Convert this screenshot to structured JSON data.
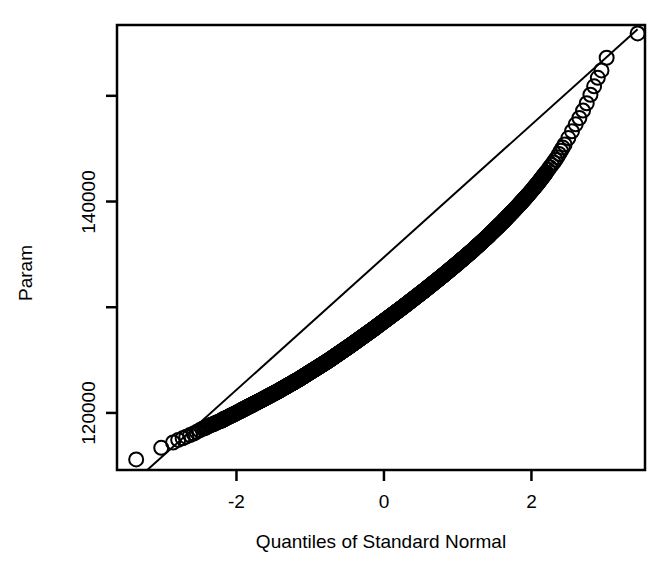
{
  "chart_data": {
    "type": "scatter",
    "subtype": "qq-plot",
    "title": "",
    "xlabel": "Quantiles of Standard Normal",
    "ylabel": "Param",
    "xlim": [
      -3.62,
      3.54
    ],
    "ylim": [
      114600,
      156700
    ],
    "grid": false,
    "legend": null,
    "x_ticks": [
      {
        "value": -2,
        "label": "-2"
      },
      {
        "value": 0,
        "label": "0"
      },
      {
        "value": 2,
        "label": "2"
      }
    ],
    "y_ticks": [
      {
        "value": 150000,
        "label": ""
      },
      {
        "value": 140000,
        "label": "140000"
      },
      {
        "value": 130000,
        "label": ""
      },
      {
        "value": 120000,
        "label": "120000"
      }
    ],
    "reference_line": {
      "name": "qq-line",
      "x1": -3.21,
      "y1": 114600,
      "x2": 3.44,
      "y2": 156300
    },
    "marker": {
      "shape": "open-circle",
      "radius_px": 7,
      "stroke": "#000000",
      "fill": "none",
      "stroke_width": 2
    },
    "series": [
      {
        "name": "Param quantiles",
        "points": [
          [
            -3.36,
            115600
          ],
          [
            -3.02,
            116700
          ],
          [
            -2.86,
            117200
          ],
          [
            -2.79,
            117450
          ],
          [
            -2.73,
            117600
          ],
          [
            -2.68,
            117750
          ],
          [
            -2.63,
            117900
          ],
          [
            -2.58,
            118050
          ],
          [
            -2.54,
            118200
          ],
          [
            -2.5,
            118350
          ],
          [
            -2.46,
            118500
          ],
          [
            -2.42,
            118600
          ],
          [
            -2.38,
            118750
          ],
          [
            -2.35,
            118850
          ],
          [
            -2.31,
            118950
          ],
          [
            -2.28,
            119050
          ],
          [
            -2.25,
            119150
          ],
          [
            -2.21,
            119250
          ],
          [
            -2.18,
            119380
          ],
          [
            -2.15,
            119480
          ],
          [
            -2.1,
            119650
          ],
          [
            -2.05,
            119820
          ],
          [
            -2.0,
            120000
          ],
          [
            -1.95,
            120180
          ],
          [
            -1.9,
            120360
          ],
          [
            -1.85,
            120540
          ],
          [
            -1.8,
            120720
          ],
          [
            -1.75,
            120900
          ],
          [
            -1.7,
            121080
          ],
          [
            -1.65,
            121260
          ],
          [
            -1.6,
            121450
          ],
          [
            -1.55,
            121630
          ],
          [
            -1.5,
            121820
          ],
          [
            -1.45,
            122000
          ],
          [
            -1.4,
            122200
          ],
          [
            -1.35,
            122400
          ],
          [
            -1.3,
            122600
          ],
          [
            -1.25,
            122800
          ],
          [
            -1.2,
            123000
          ],
          [
            -1.15,
            123200
          ],
          [
            -1.1,
            123420
          ],
          [
            -1.05,
            123640
          ],
          [
            -1.0,
            123860
          ],
          [
            -0.95,
            124080
          ],
          [
            -0.9,
            124300
          ],
          [
            -0.85,
            124520
          ],
          [
            -0.8,
            124740
          ],
          [
            -0.75,
            124960
          ],
          [
            -0.7,
            125200
          ],
          [
            -0.65,
            125440
          ],
          [
            -0.6,
            125680
          ],
          [
            -0.55,
            125920
          ],
          [
            -0.5,
            126160
          ],
          [
            -0.45,
            126400
          ],
          [
            -0.4,
            126650
          ],
          [
            -0.35,
            126900
          ],
          [
            -0.3,
            127150
          ],
          [
            -0.25,
            127400
          ],
          [
            -0.2,
            127650
          ],
          [
            -0.15,
            127900
          ],
          [
            -0.1,
            128160
          ],
          [
            -0.05,
            128420
          ],
          [
            0.0,
            128680
          ],
          [
            0.05,
            128940
          ],
          [
            0.1,
            129200
          ],
          [
            0.15,
            129460
          ],
          [
            0.2,
            129720
          ],
          [
            0.25,
            129980
          ],
          [
            0.3,
            130250
          ],
          [
            0.35,
            130520
          ],
          [
            0.4,
            130790
          ],
          [
            0.45,
            131060
          ],
          [
            0.5,
            131330
          ],
          [
            0.55,
            131600
          ],
          [
            0.6,
            131880
          ],
          [
            0.65,
            132160
          ],
          [
            0.7,
            132440
          ],
          [
            0.75,
            132720
          ],
          [
            0.8,
            133000
          ],
          [
            0.85,
            133290
          ],
          [
            0.9,
            133580
          ],
          [
            0.95,
            133870
          ],
          [
            1.0,
            134160
          ],
          [
            1.05,
            134460
          ],
          [
            1.1,
            134760
          ],
          [
            1.15,
            135060
          ],
          [
            1.2,
            135360
          ],
          [
            1.25,
            135680
          ],
          [
            1.3,
            136000
          ],
          [
            1.35,
            136320
          ],
          [
            1.4,
            136640
          ],
          [
            1.45,
            136980
          ],
          [
            1.5,
            137320
          ],
          [
            1.55,
            137660
          ],
          [
            1.6,
            138000
          ],
          [
            1.65,
            138360
          ],
          [
            1.7,
            138720
          ],
          [
            1.75,
            139080
          ],
          [
            1.8,
            139450
          ],
          [
            1.85,
            139830
          ],
          [
            1.9,
            140210
          ],
          [
            1.95,
            140600
          ],
          [
            2.0,
            141000
          ],
          [
            2.05,
            141420
          ],
          [
            2.1,
            141850
          ],
          [
            2.15,
            142300
          ],
          [
            2.2,
            142760
          ],
          [
            2.25,
            143240
          ],
          [
            2.3,
            143700
          ],
          [
            2.35,
            144200
          ],
          [
            2.4,
            144800
          ],
          [
            2.45,
            145400
          ],
          [
            2.5,
            146000
          ],
          [
            2.55,
            146650
          ],
          [
            2.6,
            147300
          ],
          [
            2.65,
            147900
          ],
          [
            2.7,
            148600
          ],
          [
            2.75,
            149300
          ],
          [
            2.8,
            150100
          ],
          [
            2.85,
            150900
          ],
          [
            2.9,
            151700
          ],
          [
            2.95,
            152400
          ],
          [
            3.02,
            153600
          ],
          [
            3.44,
            155900
          ]
        ]
      }
    ],
    "annotations": {
      "lower_tail": "Lower-tail points fall above the reference line",
      "upper_tail": "Upper-tail points fall slightly above the reference line",
      "center": "Dense overplotted band of open circles along the line"
    }
  },
  "axes": {
    "x_title": "Quantiles of Standard Normal",
    "y_title": "Param",
    "x_tick_labels": [
      "-2",
      "0",
      "2"
    ],
    "y_tick_labels": [
      "140000",
      "120000"
    ]
  },
  "colors": {
    "background": "#ffffff",
    "foreground": "#000000",
    "marker_stroke": "#000000",
    "line": "#000000"
  }
}
